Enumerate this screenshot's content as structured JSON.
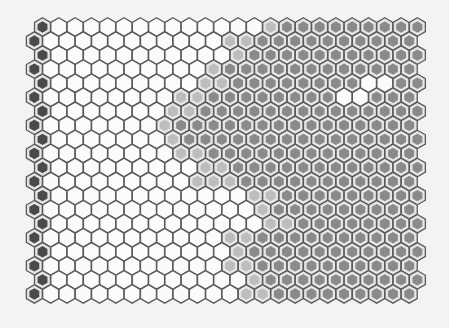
{
  "figure": {
    "type": "hexagonal-grid",
    "rows": 20,
    "cols": 24,
    "legend_codes": {
      "D": "dark-marker",
      "W": "white-cell",
      "L": "light-gray-cell",
      "M": "medium-gray-cell"
    },
    "colors": {
      "background": "#f3f3f3",
      "stroke": "#5a5a5a",
      "D": "#4a4a4a",
      "W": "#fbfbfb",
      "L": "#bdbdbd",
      "M": "#8a8a8a",
      "ring": "#e6e6e6"
    },
    "grid_rows": [
      "DWWWWWWWWWWWWWLMMMMMMMMMM",
      "DWWWWWWWWWWWLLMMMMMMMMMMM",
      "DWWWWWWWWWWWLMMMMMMMMMMMM",
      "DWWWWWWWWWWLMMMMMMMMMMMMM",
      "DWWWWWWWWWLLMMMMMMMMWWMMM",
      "DWWWWWWWWLLMMMMMMMMWWMMMM",
      "DWWWWWWWLLMMMMMMMMMMMMMMM",
      "DWWWWWWWLMMMMMMMMMMMMMMMM",
      "DWWWWWWWLMMMMMMMMMMMMMMMM",
      "DWWWWWWWWLLMMMMMMMMMMMMMM",
      "DWWWWWWWWWLLMMMMMMMMMMMMM",
      "DWWWWWWWWWLLLMMMMMMMMMMMM",
      "DWWWWWWWWWWWWLLMMMMMMMMMM",
      "DWWWWWWWWWWWWWLMMMMMMMMMM",
      "DWWWWWWWWWWWWWLLMMMMMMMMM",
      "DWWWWWWWWWWWLLMMMMMMMMMMM",
      "DWWWWWWWWWWWLMMMMMMMMMMMM",
      "DWWWWWWWWWWWLLMMMMMMMMMMM",
      "DWWWWWWWWWWWWLMMMMMMMMMMM",
      "DWWWWWWWWWWWWLLMMMMMMMMMM"
    ]
  }
}
